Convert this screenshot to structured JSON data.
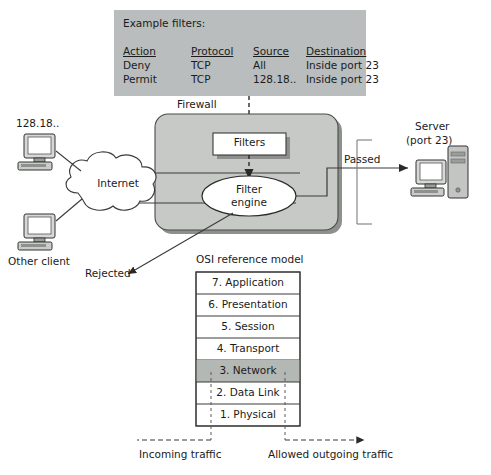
{
  "figure": {
    "colors": {
      "panel_gray": "#b9bdbd",
      "firewall_gray": "#c6c9c6",
      "highlight_gray": "#b4b8b4",
      "white": "#ffffff",
      "line": "#3a3a3a",
      "text": "#1b1b1b",
      "shadow": "#8d908d"
    }
  },
  "example_filters": {
    "caption": "Example filters:",
    "columns": [
      "Action",
      "Protocol",
      "Source",
      "Destination"
    ],
    "rows": [
      [
        "Deny",
        "TCP",
        "All",
        "Inside port 23"
      ],
      [
        "Permit",
        "TCP",
        "128.18..",
        "Inside port 23"
      ]
    ]
  },
  "firewall": {
    "label": "Firewall",
    "filters_box_label": "Filters",
    "filter_engine_line1": "Filter",
    "filter_engine_line2": "engine"
  },
  "network": {
    "client_top_label": "128.18..",
    "client_bottom_label": "Other client",
    "cloud_label": "Internet",
    "passed_label": "Passed",
    "rejected_label": "Rejected",
    "server_line1": "Server",
    "server_line2": "(port 23)"
  },
  "osi": {
    "title": "OSI reference model",
    "layers": [
      {
        "name": "7. Application",
        "highlighted": false
      },
      {
        "name": "6. Presentation",
        "highlighted": false
      },
      {
        "name": "5. Session",
        "highlighted": false
      },
      {
        "name": "4. Transport",
        "highlighted": false
      },
      {
        "name": "3. Network",
        "highlighted": true
      },
      {
        "name": "2. Data Link",
        "highlighted": false
      },
      {
        "name": "1. Physical",
        "highlighted": false
      }
    ]
  },
  "traffic": {
    "incoming_label": "Incoming traffic",
    "outgoing_label": "Allowed outgoing traffic"
  }
}
